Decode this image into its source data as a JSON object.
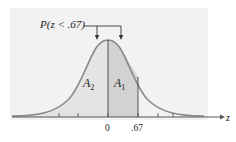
{
  "diagram": {
    "type": "standard-normal-curve",
    "probability_label": "P(z < .67)",
    "regions": [
      {
        "name": "A2",
        "label_main": "A",
        "label_sub": "2",
        "from": "-inf",
        "to": "0",
        "fill": "#e4e4e4"
      },
      {
        "name": "A1",
        "label_main": "A",
        "label_sub": "1",
        "from": "0",
        "to": ".67",
        "fill": "#d2d2d2"
      }
    ],
    "axis": {
      "variable": "z",
      "tick_labels": [
        "0",
        ".67"
      ]
    },
    "colors": {
      "panel": "#f2f2f2",
      "curve": "#8a8a8a",
      "axis": "#555555",
      "bracket": "#333333"
    }
  }
}
